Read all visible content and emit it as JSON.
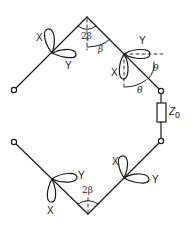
{
  "diagram": {
    "type": "antenna-array-orbital-diagram",
    "colors": {
      "line": "#1a1a1a",
      "background": "#ffffff"
    },
    "labels": {
      "top_angle": "2β",
      "upper_right_angle_beta": "β",
      "theta_upper": "θ",
      "theta_lower": "θ",
      "bottom_angle": "2β",
      "impedance": "Z",
      "impedance_sub": "0",
      "upper_left_x": "X",
      "upper_left_y": "Y",
      "upper_right_x": "X",
      "upper_right_y": "Y",
      "lower_left_x": "X",
      "lower_left_y": "Y",
      "lower_right_x": "X",
      "lower_right_y": "Y"
    },
    "nodes": [
      {
        "id": "top-apex",
        "x": 87,
        "y": 17
      },
      {
        "id": "upper-left-element",
        "x": 52,
        "y": 53
      },
      {
        "id": "upper-right-element",
        "x": 124,
        "y": 54
      },
      {
        "id": "upper-left-terminal",
        "x": 14,
        "y": 90
      },
      {
        "id": "right-top-terminal",
        "x": 161,
        "y": 91
      },
      {
        "id": "right-bottom-terminal",
        "x": 161,
        "y": 141
      },
      {
        "id": "lower-left-terminal",
        "x": 14,
        "y": 142
      },
      {
        "id": "lower-left-element",
        "x": 52,
        "y": 179
      },
      {
        "id": "lower-right-element",
        "x": 124,
        "y": 178
      },
      {
        "id": "bottom-apex",
        "x": 88,
        "y": 214
      }
    ]
  }
}
